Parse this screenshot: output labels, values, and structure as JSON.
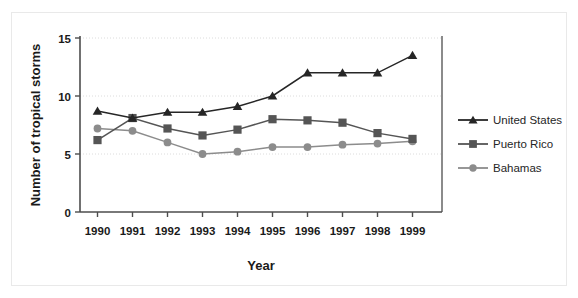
{
  "chart_data": {
    "type": "line",
    "title": "",
    "xlabel": "Year",
    "ylabel": "Number of tropical storms",
    "categories": [
      "1990",
      "1991",
      "1992",
      "1993",
      "1994",
      "1995",
      "1996",
      "1997",
      "1998",
      "1999"
    ],
    "series": [
      {
        "name": "United States",
        "marker": "triangle",
        "color": "#262626",
        "values": [
          8.7,
          8.1,
          8.6,
          8.6,
          9.1,
          10.0,
          12.0,
          12.0,
          12.0,
          13.5
        ]
      },
      {
        "name": "Puerto Rico",
        "marker": "square",
        "color": "#555555",
        "values": [
          6.2,
          8.1,
          7.2,
          6.6,
          7.1,
          8.0,
          7.9,
          7.7,
          6.8,
          6.3
        ]
      },
      {
        "name": "Bahamas",
        "marker": "circle",
        "color": "#8c8c8c",
        "values": [
          7.2,
          7.0,
          6.0,
          5.0,
          5.2,
          5.6,
          5.6,
          5.8,
          5.9,
          6.1
        ]
      }
    ],
    "yticks": [
      "0",
      "5",
      "10",
      "15"
    ],
    "ytick_values": [
      0,
      5,
      10,
      15
    ],
    "ylim": [
      0,
      15
    ],
    "grid": true,
    "gridlines_at": [
      5,
      10,
      15
    ],
    "legend_position": "right"
  },
  "axes": {
    "y_axis_title": "Number of tropical storms",
    "x_axis_title": "Year"
  },
  "legend": {
    "entries": [
      {
        "label": "United States"
      },
      {
        "label": "Puerto Rico"
      },
      {
        "label": "Bahamas"
      }
    ]
  },
  "colors": {
    "background": "#ffffff",
    "frame": "#e9e9e9",
    "axis": "#4d4d4d",
    "grid": "#dcdcdc",
    "text": "#1a1a1a"
  }
}
